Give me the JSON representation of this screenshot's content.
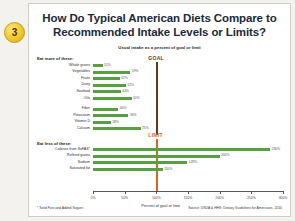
{
  "badge": {
    "number": "3"
  },
  "slide": {
    "title": "How Do Typical American Diets Compare to Recommended Intake Levels or Limits?",
    "subtitle": "Usual intake as a percent of goal or limit",
    "footnote": "* Solid Fats and Added Sugars",
    "source": "Source: USDA & HHS: Dietary Guidelines for Americans, 2010"
  },
  "chart_data": {
    "type": "bar",
    "orientation": "horizontal",
    "title": "How Do Typical American Diets Compare to Recommended Intake Levels or Limits?",
    "subtitle": "Usual intake as a percent of goal or limit",
    "xlabel": "Percent of goal or limit",
    "ylabel": "",
    "xlim": [
      0,
      300
    ],
    "xticks": [
      0,
      50,
      100,
      150,
      200,
      250,
      300
    ],
    "xticklabels": [
      "0%",
      "50%",
      "100%",
      "150%",
      "200%",
      "250%",
      "300%"
    ],
    "grid": false,
    "legend": "none",
    "bar_color": "#5a9e43",
    "groups": [
      {
        "heading": "Eat more of these:",
        "reference_line": {
          "label": "GOAL",
          "value": 100,
          "color": "#5b3a16"
        },
        "categories": [
          "Whole grains",
          "Vegetables",
          "Fruits",
          "Dairy",
          "Seafood",
          "Oils",
          "Fiber",
          "Potassium",
          "Vitamin D",
          "Calcium"
        ],
        "values": [
          15,
          59,
          42,
          52,
          44,
          61,
          40,
          56,
          28,
          75
        ],
        "value_labels": [
          "15%",
          "59%",
          "42%",
          "52%",
          "44%",
          "61%",
          "40%",
          "56%",
          "28%",
          "75%"
        ]
      },
      {
        "heading": "Eat less of these:",
        "reference_line": {
          "label": "LIMIT",
          "value": 100,
          "color": "#d2691e"
        },
        "categories": [
          "Calories from SoFAS*",
          "Refined grains",
          "Sodium",
          "Saturated fat"
        ],
        "values": [
          280,
          200,
          149,
          110
        ],
        "value_labels": [
          "280%",
          "200%",
          "149%",
          "110%"
        ]
      }
    ]
  }
}
